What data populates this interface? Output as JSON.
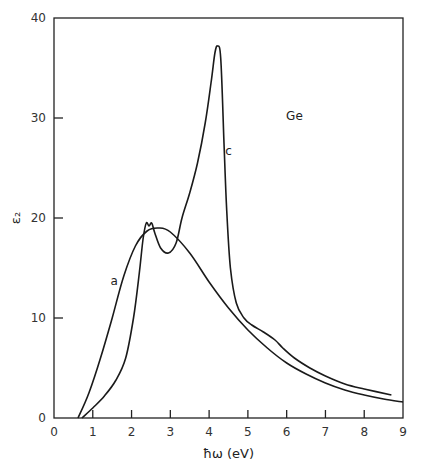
{
  "chart_data": {
    "type": "line",
    "title": "",
    "xlabel": "ħω (eV)",
    "ylabel": "ε₂",
    "xlim": [
      0,
      9
    ],
    "ylim": [
      0,
      40
    ],
    "xticks": [
      0,
      1,
      2,
      3,
      4,
      5,
      6,
      7,
      8,
      9
    ],
    "yticks": [
      0,
      10,
      20,
      30,
      40
    ],
    "grid": false,
    "annotations": [
      {
        "text": "Ge",
        "x": 6.2,
        "y": 29.8
      },
      {
        "text": "c",
        "x": 4.5,
        "y": 26.3
      },
      {
        "text": "a",
        "x": 1.55,
        "y": 13.3
      }
    ],
    "series": [
      {
        "name": "a",
        "x": [
          0.62,
          0.9,
          1.2,
          1.5,
          1.8,
          2.1,
          2.4,
          2.7,
          3.0,
          3.5,
          4.0,
          4.5,
          5.0,
          5.5,
          6.0,
          6.5,
          7.0,
          7.5,
          8.0,
          8.5,
          9.0
        ],
        "y": [
          0.0,
          2.5,
          6.0,
          10.0,
          14.2,
          17.2,
          18.7,
          19.0,
          18.6,
          16.5,
          13.6,
          11.0,
          8.8,
          7.0,
          5.5,
          4.4,
          3.5,
          2.8,
          2.3,
          1.9,
          1.6
        ]
      },
      {
        "name": "c",
        "x": [
          0.72,
          1.0,
          1.3,
          1.6,
          1.85,
          2.05,
          2.2,
          2.3,
          2.38,
          2.45,
          2.52,
          2.6,
          2.75,
          2.95,
          3.15,
          3.3,
          3.5,
          3.7,
          3.9,
          4.05,
          4.15,
          4.22,
          4.3,
          4.38,
          4.45,
          4.55,
          4.7,
          4.9,
          5.1,
          5.4,
          5.7,
          5.9,
          6.2,
          6.6,
          7.0,
          7.5,
          8.0,
          8.7
        ],
        "y": [
          0.0,
          1.0,
          2.2,
          3.8,
          6.0,
          10.0,
          14.5,
          18.0,
          19.5,
          19.2,
          19.5,
          18.5,
          17.0,
          16.5,
          17.5,
          20.0,
          22.5,
          25.5,
          29.5,
          33.5,
          36.5,
          37.2,
          36.0,
          28.0,
          21.0,
          15.0,
          11.5,
          10.0,
          9.3,
          8.6,
          7.8,
          7.0,
          6.0,
          5.0,
          4.2,
          3.4,
          2.9,
          2.3
        ]
      }
    ]
  }
}
